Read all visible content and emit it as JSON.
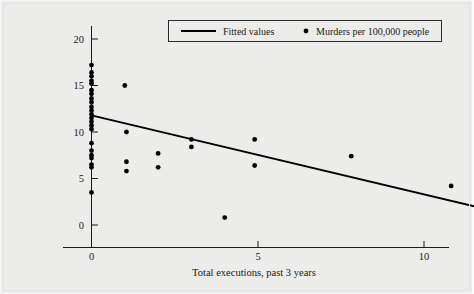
{
  "chart_data": {
    "type": "scatter",
    "title": "",
    "xlabel": "Total executions, past 3 years",
    "ylabel": "",
    "xlim": [
      -0.65,
      11.6
    ],
    "ylim": [
      -2.2,
      21.5
    ],
    "xticks": [
      0,
      5,
      10
    ],
    "xtick_labels": [
      "0",
      "5",
      "10"
    ],
    "yticks": [
      0,
      5,
      10,
      15,
      20
    ],
    "ytick_labels": [
      "0",
      "5",
      "10",
      "15",
      "20"
    ],
    "grid": false,
    "legend_position": "top-center",
    "series": [
      {
        "name": "Murders per 100,000 people",
        "type": "scatter",
        "marker": "circle",
        "color": "#000000",
        "points": [
          [
            0,
            17.2
          ],
          [
            0,
            16.4
          ],
          [
            0,
            16.0
          ],
          [
            0,
            15.5
          ],
          [
            0,
            15.2
          ],
          [
            0,
            14.5
          ],
          [
            0,
            14.1
          ],
          [
            0,
            13.6
          ],
          [
            0,
            13.2
          ],
          [
            0,
            12.7
          ],
          [
            0,
            12.3
          ],
          [
            0,
            11.9
          ],
          [
            0,
            11.5
          ],
          [
            0,
            11.1
          ],
          [
            0,
            10.7
          ],
          [
            0,
            10.3
          ],
          [
            0,
            8.8
          ],
          [
            0,
            8.0
          ],
          [
            0,
            7.5
          ],
          [
            0,
            7.2
          ],
          [
            0,
            6.5
          ],
          [
            0,
            6.2
          ],
          [
            0,
            3.5
          ],
          [
            1.0,
            15.0
          ],
          [
            1.05,
            10.0
          ],
          [
            1.05,
            6.8
          ],
          [
            1.05,
            5.8
          ],
          [
            2.0,
            7.7
          ],
          [
            2.0,
            6.2
          ],
          [
            3.0,
            9.2
          ],
          [
            3.0,
            8.4
          ],
          [
            4.0,
            0.8
          ],
          [
            4.9,
            9.2
          ],
          [
            4.9,
            6.4
          ],
          [
            7.8,
            7.4
          ],
          [
            10.8,
            4.2
          ]
        ]
      },
      {
        "name": "Fitted values",
        "type": "line",
        "color": "#000000",
        "endpoints": [
          [
            0,
            11.8
          ],
          [
            11.5,
            2.0
          ]
        ],
        "slope": -0.852,
        "intercept": 11.8
      }
    ],
    "legend_entries": [
      {
        "label": "Fitted values",
        "marker": "line"
      },
      {
        "label": "Murders per 100,000 people",
        "marker": "dot"
      }
    ]
  },
  "axes": {
    "x_axis_label": "Total executions, past 3 years",
    "y_axis_label": ""
  }
}
